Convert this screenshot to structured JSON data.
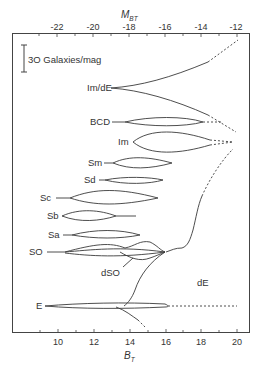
{
  "top_axis": {
    "title": "M",
    "title_sub": "BT",
    "ticks": [
      "-22",
      "-20",
      "-18",
      "-16",
      "-14",
      "-12"
    ]
  },
  "bottom_axis": {
    "title": "B",
    "title_sub": "T",
    "ticks": [
      "10",
      "12",
      "14",
      "16",
      "18",
      "20"
    ]
  },
  "scale_bar": {
    "label": "3O Galaxies/mag"
  },
  "types": {
    "im_de": "Im/dE",
    "bcd": "BCD",
    "im": "Im",
    "sm": "Sm",
    "sd": "Sd",
    "sc": "Sc",
    "sb": "Sb",
    "sa": "Sa",
    "so": "SO",
    "dso": "dSO",
    "de": "dE",
    "e": "E"
  },
  "colors": {
    "line": "#3a3a3a",
    "frame": "#444444"
  }
}
